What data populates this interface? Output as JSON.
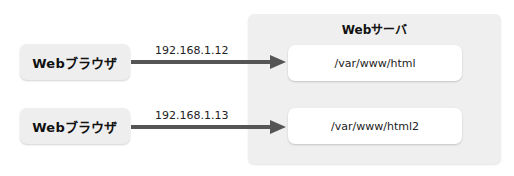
{
  "browsers": [
    {
      "label": "Webブラウザ"
    },
    {
      "label": "Webブラウザ"
    }
  ],
  "connections": [
    {
      "ip": "192.168.1.12",
      "from": "browser-1",
      "to": "docroot-1"
    },
    {
      "ip": "192.168.1.13",
      "from": "browser-2",
      "to": "docroot-2"
    }
  ],
  "server": {
    "title": "Webサーバ",
    "docroots": [
      {
        "path": "/var/www/html"
      },
      {
        "path": "/var/www/html2"
      }
    ]
  },
  "colors": {
    "arrow": "#555555",
    "browser_box": "#eeeeee",
    "server_box": "#efefef",
    "docroot_box": "#ffffff"
  }
}
